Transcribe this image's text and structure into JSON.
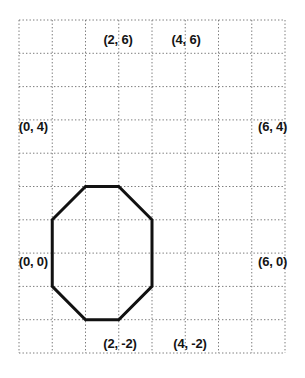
{
  "chart_data": {
    "type": "scatter",
    "title": "",
    "subtitle": "",
    "xlabel": "",
    "ylabel": "",
    "grid": true,
    "grid_style": "dotted",
    "grid_color": "#7a7a7a",
    "legend": "none",
    "shape": "octagon",
    "shape_color": "#111111",
    "shape_fill": "none",
    "shape_line_width": 3,
    "background_color": "#ffffff",
    "xlim": [
      -2,
      10
    ],
    "ylim": [
      -4,
      10
    ],
    "x_ticks": [
      -2,
      0,
      2,
      4,
      6,
      8,
      10
    ],
    "y_ticks": [
      -4,
      -2,
      0,
      2,
      4,
      6,
      8,
      10
    ],
    "grid_step": 2,
    "grid_columns": 8,
    "grid_rows": 10,
    "axis_labels_shown": false,
    "tick_labels_shown": false,
    "vertices": [
      {
        "name": "vertex-0-4",
        "x": 0,
        "y": 4,
        "label": "(0, 4)",
        "label_side": "left"
      },
      {
        "name": "vertex-2-6",
        "x": 2,
        "y": 6,
        "label": "(2, 6)",
        "label_side": "above"
      },
      {
        "name": "vertex-4-6",
        "x": 4,
        "y": 6,
        "label": "(4, 6)",
        "label_side": "above"
      },
      {
        "name": "vertex-6-4",
        "x": 6,
        "y": 4,
        "label": "(6, 4)",
        "label_side": "right"
      },
      {
        "name": "vertex-6-0",
        "x": 6,
        "y": 0,
        "label": "(6, 0)",
        "label_side": "right"
      },
      {
        "name": "vertex-4-m2",
        "x": 4,
        "y": -2,
        "label": "(4, -2)",
        "label_side": "below"
      },
      {
        "name": "vertex-2-m2",
        "x": 2,
        "y": -2,
        "label": "(2, -2)",
        "label_side": "below"
      },
      {
        "name": "vertex-0-0",
        "x": 0,
        "y": 0,
        "label": "(0, 0)",
        "label_side": "left"
      }
    ],
    "edges": [
      {
        "from": "(0, 4)",
        "to": "(2, 6)"
      },
      {
        "from": "(2, 6)",
        "to": "(4, 6)"
      },
      {
        "from": "(4, 6)",
        "to": "(6, 4)"
      },
      {
        "from": "(6, 4)",
        "to": "(6, 0)"
      },
      {
        "from": "(6, 0)",
        "to": "(4, -2)"
      },
      {
        "from": "(4, -2)",
        "to": "(2, -2)"
      },
      {
        "from": "(2, -2)",
        "to": "(0, 0)"
      },
      {
        "from": "(0, 0)",
        "to": "(0, 4)"
      }
    ]
  },
  "labels": {
    "p0_4": "(0, 4)",
    "p2_6": "(2, 6)",
    "p4_6": "(4, 6)",
    "p6_4": "(6, 4)",
    "p6_0": "(6, 0)",
    "p4_m2": "(4, -2)",
    "p2_m2": "(2, -2)",
    "p0_0": "(0, 0)"
  }
}
